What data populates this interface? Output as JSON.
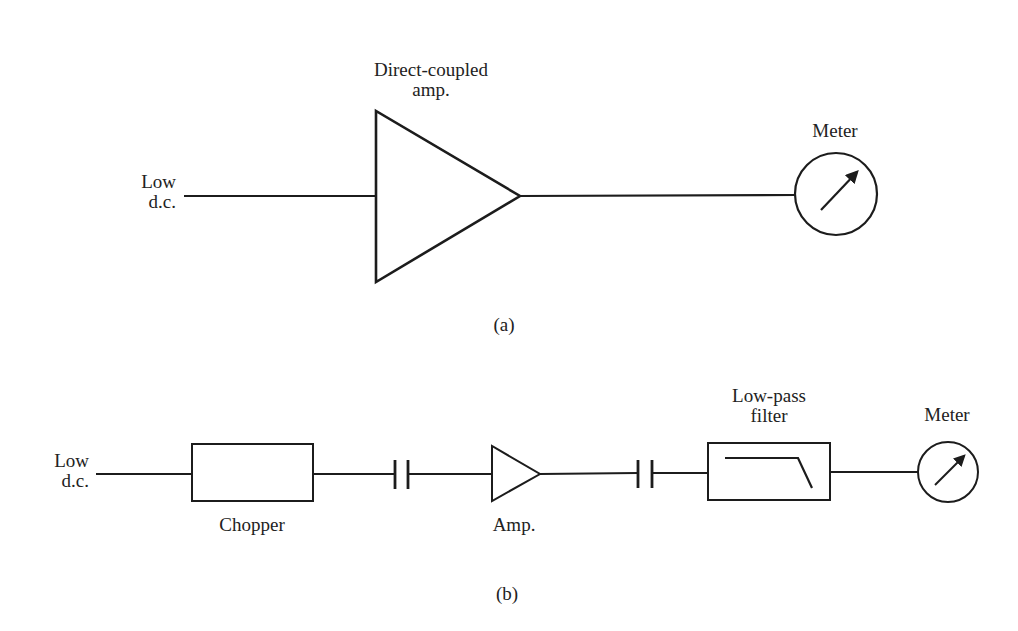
{
  "style": {
    "ink": "#1c1c1c",
    "text": "#222222",
    "background": "#ffffff",
    "font_size": 19
  },
  "diagram_a": {
    "caption": {
      "text": "(a)",
      "x": 504,
      "y": 331
    },
    "input_label": {
      "lines": [
        "Low",
        "d.c."
      ],
      "x": 176,
      "y": 188,
      "anchor": "end"
    },
    "amp_label": {
      "lines": [
        "Direct-coupled",
        "amp."
      ],
      "x": 431,
      "y": 76,
      "anchor": "middle"
    },
    "meter_label": {
      "lines": [
        "Meter"
      ],
      "x": 835,
      "y": 137,
      "anchor": "middle"
    },
    "wires": [
      {
        "x1": 184,
        "y1": 196,
        "x2": 376,
        "y2": 196,
        "w": 2.2
      },
      {
        "x1": 520,
        "y1": 196,
        "x2": 796,
        "y2": 195,
        "w": 2.2
      }
    ],
    "amp": {
      "points": "376,111 376,282 520,196",
      "w": 2.6
    },
    "meter": {
      "cx": 836,
      "cy": 194,
      "r": 41,
      "w": 2.2,
      "needle": [
        821,
        210,
        857,
        172
      ]
    }
  },
  "diagram_b": {
    "caption": {
      "text": "(b)",
      "x": 507,
      "y": 600
    },
    "input_label": {
      "lines": [
        "Low",
        "d.c."
      ],
      "x": 89,
      "y": 467,
      "anchor": "end"
    },
    "chopper_label": {
      "lines": [
        "Chopper"
      ],
      "x": 252,
      "y": 531,
      "anchor": "middle"
    },
    "amp_label": {
      "lines": [
        "Amp."
      ],
      "x": 514,
      "y": 531,
      "anchor": "middle"
    },
    "filter_label": {
      "lines": [
        "Low-pass",
        "filter"
      ],
      "x": 769,
      "y": 402,
      "anchor": "middle"
    },
    "meter_label": {
      "lines": [
        "Meter"
      ],
      "x": 947,
      "y": 421,
      "anchor": "middle"
    },
    "wires": [
      {
        "x1": 96,
        "y1": 474,
        "x2": 192,
        "y2": 474,
        "w": 2.2
      },
      {
        "x1": 313,
        "y1": 474,
        "x2": 395,
        "y2": 474,
        "w": 2.2
      },
      {
        "x1": 408,
        "y1": 474,
        "x2": 492,
        "y2": 474,
        "w": 2.2
      },
      {
        "x1": 540,
        "y1": 474,
        "x2": 638,
        "y2": 473,
        "w": 2.2
      },
      {
        "x1": 652,
        "y1": 473,
        "x2": 708,
        "y2": 473,
        "w": 2.2
      },
      {
        "x1": 830,
        "y1": 472,
        "x2": 918,
        "y2": 472,
        "w": 2.2
      }
    ],
    "chopper": {
      "x": 192,
      "y": 444,
      "w": 121,
      "h": 57,
      "stroke": 2
    },
    "capacitors": [
      {
        "x1": 395,
        "x2": 408,
        "y1": 460,
        "y2": 489,
        "w": 2.8
      },
      {
        "x1": 638,
        "x2": 652,
        "y1": 460,
        "y2": 488,
        "w": 2.8
      }
    ],
    "amp": {
      "points": "492,446 492,501 540,474",
      "w": 2
    },
    "filter": {
      "x": 708,
      "y": 443,
      "w": 122,
      "h": 57,
      "stroke": 2,
      "response": "725,458 798,458 812,488"
    },
    "meter": {
      "cx": 948,
      "cy": 472,
      "r": 30,
      "w": 2,
      "needle": [
        935,
        485,
        964,
        456
      ]
    }
  }
}
